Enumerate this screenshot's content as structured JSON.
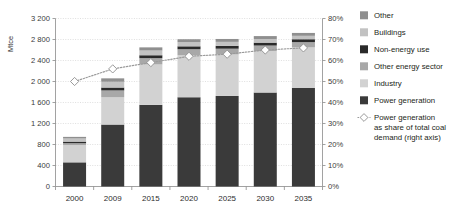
{
  "chart_data": {
    "type": "bar",
    "title": "",
    "subtitle": "",
    "xlabel": "",
    "ylabel": "Mtce",
    "ylabel_right": "",
    "categories": [
      "2000",
      "2009",
      "2015",
      "2020",
      "2025",
      "2030",
      "2035"
    ],
    "ylim": [
      0,
      3200
    ],
    "ytick_labels": [
      "0",
      "400",
      "800",
      "1 200",
      "1 600",
      "2 000",
      "2 400",
      "2 800",
      "3 200"
    ],
    "ytick_values": [
      0,
      400,
      800,
      1200,
      1600,
      2000,
      2400,
      2800,
      3200
    ],
    "ylim_right": [
      0,
      80
    ],
    "ytick_labels_right": [
      "0%",
      "10%",
      "20%",
      "30%",
      "40%",
      "50%",
      "60%",
      "70%",
      "80%"
    ],
    "ytick_values_right": [
      0,
      10,
      20,
      30,
      40,
      50,
      60,
      70,
      80
    ],
    "grid": true,
    "legend_position": "right",
    "stack_order_bottom_to_top": [
      "Power generation",
      "Industry",
      "Other energy sector",
      "Non-energy use",
      "Buildings",
      "Other"
    ],
    "series": [
      {
        "name": "Power generation",
        "color": "#3a3a3a",
        "values": [
          460,
          1180,
          1555,
          1700,
          1725,
          1790,
          1880
        ]
      },
      {
        "name": "Industry",
        "color": "#d2d2d2",
        "values": [
          330,
          520,
          770,
          800,
          790,
          790,
          770
        ]
      },
      {
        "name": "Other energy sector",
        "color": "#a8a8a8",
        "values": [
          35,
          130,
          120,
          115,
          110,
          105,
          100
        ]
      },
      {
        "name": "Non-energy use",
        "color": "#2a2a2a",
        "values": [
          30,
          55,
          55,
          55,
          55,
          55,
          55
        ]
      },
      {
        "name": "Buildings",
        "color": "#c2c2c2",
        "values": [
          60,
          110,
          90,
          80,
          75,
          70,
          65
        ]
      },
      {
        "name": "Other",
        "color": "#8f8f8f",
        "values": [
          30,
          65,
          60,
          55,
          55,
          55,
          55
        ]
      }
    ],
    "line_series": {
      "name": "Power generation as share of total coal demand (right axis)",
      "axis": "right",
      "unit": "%",
      "color": "#9a9a9a",
      "marker": "diamond",
      "values": [
        50,
        56,
        59,
        62,
        63,
        65,
        66
      ]
    },
    "bar_totals": [
      945,
      2060,
      2650,
      2805,
      2810,
      2865,
      2925
    ]
  },
  "legend": {
    "items": [
      {
        "label": "Other",
        "color": "#8f8f8f",
        "type": "swatch"
      },
      {
        "label": "Buildings",
        "color": "#c2c2c2",
        "type": "swatch"
      },
      {
        "label": "Non-energy use",
        "color": "#2a2a2a",
        "type": "swatch"
      },
      {
        "label": "Other energy sector",
        "color": "#a8a8a8",
        "type": "swatch"
      },
      {
        "label": "Industry",
        "color": "#d2d2d2",
        "type": "swatch"
      },
      {
        "label": "Power generation",
        "color": "#3a3a3a",
        "type": "swatch"
      },
      {
        "label": "Power generation",
        "label2": "as share of total coal",
        "label3": "demand (right axis)",
        "color": "#9a9a9a",
        "type": "line-marker"
      }
    ]
  }
}
